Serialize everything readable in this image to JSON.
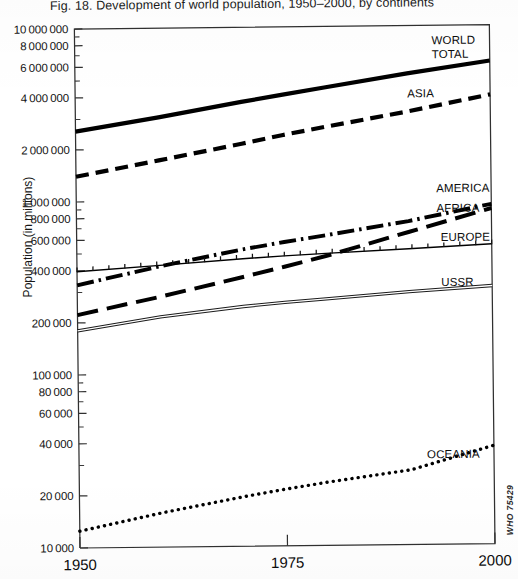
{
  "figure": {
    "title": "Fig. 18. Development of world population, 1950–2000, by continents",
    "credit": "WHO 75429"
  },
  "chart_data": {
    "type": "line",
    "title": "Fig. 18. Development of world population, 1950–2000, by continents",
    "xlabel": "",
    "ylabel": "Population (in millions)",
    "yscale": "log",
    "ylim": [
      10000,
      10000000
    ],
    "xlim": [
      1950,
      2000
    ],
    "grid": false,
    "legend_position": "right-inline-labels",
    "x_ticks": [
      1950,
      1975,
      2000
    ],
    "x_tick_labels": [
      "1950",
      "1975",
      "2000"
    ],
    "y_ticks": [
      10000,
      20000,
      40000,
      60000,
      80000,
      100000,
      200000,
      400000,
      600000,
      800000,
      1000000,
      2000000,
      4000000,
      6000000,
      8000000,
      10000000
    ],
    "y_tick_labels": [
      "10000",
      "20000",
      "40000",
      "60000",
      "80000",
      "100000",
      "200000",
      "400000",
      "600000",
      "800000",
      "1000000",
      "2000000",
      "4000000",
      "6000000",
      "8000000",
      "10000000"
    ],
    "x": [
      1950,
      1960,
      1970,
      1975,
      1980,
      1990,
      2000
    ],
    "series": [
      {
        "name": "WORLD TOTAL",
        "label": "WORLD\nTOTAL",
        "style": "solid",
        "color": "#000000",
        "values": [
          2550000,
          3050000,
          3700000,
          4050000,
          4430000,
          5280000,
          6200000
        ]
      },
      {
        "name": "ASIA",
        "label": "ASIA",
        "style": "dashed",
        "color": "#000000",
        "values": [
          1400000,
          1720000,
          2120000,
          2370000,
          2620000,
          3180000,
          3950000
        ]
      },
      {
        "name": "AMERICA",
        "label": "AMERICA",
        "style": "dash-dot",
        "color": "#000000",
        "values": [
          330000,
          420000,
          520000,
          570000,
          620000,
          740000,
          920000
        ]
      },
      {
        "name": "AFRICA",
        "label": "AFRICA",
        "style": "long-dash",
        "color": "#000000",
        "values": [
          222000,
          280000,
          360000,
          410000,
          470000,
          640000,
          870000
        ]
      },
      {
        "name": "EUROPE",
        "label": "EUROPE",
        "style": "thin-hatched",
        "color": "#000000",
        "values": [
          395000,
          425000,
          459000,
          474000,
          487000,
          512000,
          540000
        ]
      },
      {
        "name": "USSR",
        "label": "USSR",
        "style": "double-line",
        "color": "#000000",
        "values": [
          180000,
          214000,
          243000,
          255000,
          266000,
          289000,
          310000
        ]
      },
      {
        "name": "OCEANIA",
        "label": "OCEANIA",
        "style": "dotted",
        "color": "#000000",
        "values": [
          12500,
          15800,
          19400,
          21300,
          23200,
          27000,
          37000
        ]
      }
    ]
  },
  "axis": {
    "y_title": "Population (in millions)"
  }
}
